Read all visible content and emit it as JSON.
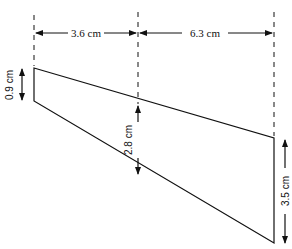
{
  "diagram": {
    "type": "trapezoid-cross-section",
    "dimensions": {
      "left_width": "3.6 cm",
      "right_width": "6.3 cm",
      "left_height": "0.9 cm",
      "middle_height": "2.8 cm",
      "right_height": "3.5 cm"
    },
    "colors": {
      "line": "#111111",
      "background": "#ffffff"
    }
  }
}
